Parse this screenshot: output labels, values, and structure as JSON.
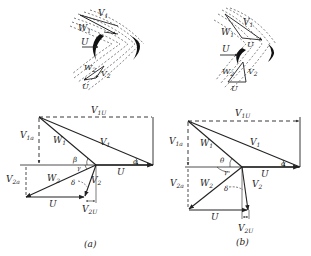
{
  "figure": {
    "background": "#ffffff",
    "ink": "#222222",
    "panels": [
      {
        "id": "a",
        "caption": "(a)",
        "blade_sketch": {
          "labels": {
            "V1": "V",
            "V1_sub": "1",
            "W1": "W",
            "W1_sub": "1",
            "U": "U",
            "W2": "W",
            "W2_sub": "2",
            "V2": "V",
            "V2_sub": "2",
            "U_bottom": "U"
          }
        },
        "velocity_diagram": {
          "labels": {
            "V1U": "V",
            "V1U_sub": "1U",
            "V1a": "V",
            "V1a_sub": "1a",
            "W1": "W",
            "W1_sub": "1",
            "V1": "V",
            "V1_sub": "1",
            "alpha": "α",
            "beta": "β",
            "gamma": "γ",
            "U_top": "U",
            "V2a": "V",
            "V2a_sub": "2a",
            "W2": "W",
            "W2_sub": "2",
            "delta": "δ",
            "V2": "V",
            "V2_sub": "2",
            "U_bottom": "U",
            "V2U": "V",
            "V2U_sub": "2U"
          }
        }
      },
      {
        "id": "b",
        "caption": "(b)",
        "blade_sketch": {
          "labels": {
            "V1": "V",
            "V1_sub": "1",
            "W1": "W",
            "W1_sub": "1",
            "U_mid": "U",
            "U": "U",
            "W2": "W",
            "W2_sub": "2",
            "V2": "V",
            "V2_sub": "2",
            "U_bottom": "U"
          }
        },
        "velocity_diagram": {
          "labels": {
            "V1U": "V",
            "V1U_sub": "1U",
            "V1a": "V",
            "V1a_sub": "1a",
            "W1": "W",
            "W1_sub": "1",
            "V1": "V",
            "V1_sub": "1",
            "alpha": "α",
            "theta": "θ",
            "gamma": "γ",
            "U_top": "U",
            "V2a": "V",
            "V2a_sub": "2a",
            "W2": "W",
            "W2_sub": "2",
            "delta": "δ",
            "V2": "V",
            "V2_sub": "2",
            "U_bottom": "U",
            "V2U": "V",
            "V2U_sub": "2U"
          }
        }
      }
    ]
  }
}
